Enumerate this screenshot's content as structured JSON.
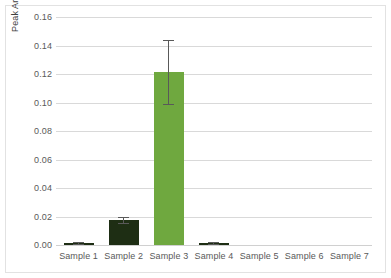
{
  "chart_data": {
    "type": "bar",
    "title": "",
    "xlabel": "",
    "ylabel": "Peak Area (normalized to IS)",
    "categories": [
      "Sample 1",
      "Sample 2",
      "Sample 3",
      "Sample 4",
      "Sample 5",
      "Sample 6",
      "Sample 7"
    ],
    "values": [
      0.0012,
      0.0178,
      0.1215,
      0.0017,
      0.0,
      0.0,
      0.0
    ],
    "errors": [
      0.0006,
      0.0022,
      0.0227,
      0.0007,
      0.0,
      0.0,
      0.0
    ],
    "error_low": [
      0.0006,
      0.0156,
      0.0988,
      0.001,
      0.0,
      0.0,
      0.0
    ],
    "error_high": [
      0.0018,
      0.02,
      0.1442,
      0.0024,
      0.0,
      0.0,
      0.0
    ],
    "bar_colors": [
      "#1E2E14",
      "#1E2E14",
      "#6FA83F",
      "#1E2E14",
      "#6FA83F",
      "#6FA83F",
      "#6FA83F"
    ],
    "ylim": [
      0.0,
      0.16
    ],
    "ytick_values": [
      0.0,
      0.02,
      0.04,
      0.06,
      0.08,
      0.1,
      0.12,
      0.14,
      0.16
    ],
    "ytick_labels": [
      "0.00",
      "0.02",
      "0.04",
      "0.06",
      "0.08",
      "0.10",
      "0.12",
      "0.14",
      "0.16"
    ],
    "grid": true,
    "grid_axis": "y",
    "legend": false,
    "error_bar_color": "#595959",
    "gridline_color": "#d9d9d9",
    "plot_background": "#ffffff"
  }
}
